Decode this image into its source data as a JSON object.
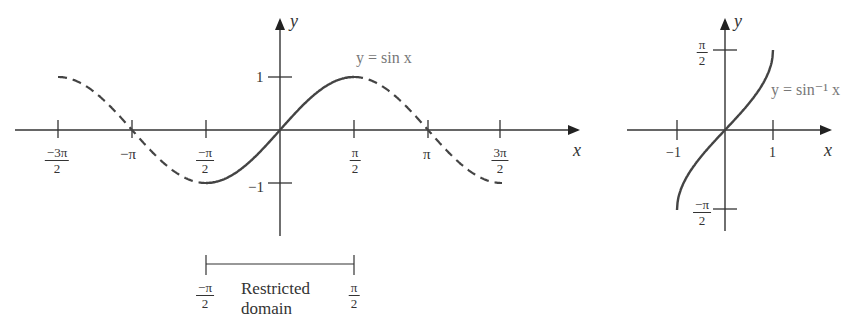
{
  "chart_data": [
    {
      "type": "line",
      "title": "y = sin x",
      "xlabel": "x",
      "ylabel": "y",
      "x_ticks": [
        "-3π/2",
        "-π",
        "-π/2",
        "π/2",
        "π",
        "3π/2"
      ],
      "y_ticks": [
        "1",
        "-1"
      ],
      "xlim": [
        -4.71,
        4.71
      ],
      "ylim": [
        -1,
        1
      ],
      "series": [
        {
          "name": "sin x (full, dashed)",
          "style": "dashed",
          "domain": [
            -4.712,
            4.712
          ]
        },
        {
          "name": "sin x (restricted, solid)",
          "style": "solid",
          "domain": [
            -1.571,
            1.571
          ]
        }
      ],
      "annotation": {
        "label": "Restricted domain",
        "from": "-π/2",
        "to": "π/2"
      }
    },
    {
      "type": "line",
      "title": "y = sin⁻¹ x",
      "xlabel": "x",
      "ylabel": "y",
      "x_ticks": [
        "-1",
        "1"
      ],
      "y_ticks": [
        "π/2",
        "-π/2"
      ],
      "xlim": [
        -1,
        1
      ],
      "ylim": [
        -1.571,
        1.571
      ],
      "series": [
        {
          "name": "arcsin x",
          "style": "solid",
          "domain": [
            -1,
            1
          ]
        }
      ]
    }
  ],
  "left_plot": {
    "axis_x_label": "x",
    "axis_y_label": "y",
    "curve_label": "y = sin x",
    "y_tick_1": "1",
    "y_tick_neg1": "−1",
    "x_ticks": {
      "neg_3pi_2": {
        "num": "−3π",
        "den": "2"
      },
      "neg_pi": "−π",
      "neg_pi_2": {
        "num": "−π",
        "den": "2"
      },
      "pi_2": {
        "num": "π",
        "den": "2"
      },
      "pi": "π",
      "pi3_2": {
        "num": "3π",
        "den": "2"
      }
    },
    "domain_bar": {
      "left": {
        "num": "−π",
        "den": "2"
      },
      "right": {
        "num": "π",
        "den": "2"
      },
      "caption_line1": "Restricted",
      "caption_line2": "domain"
    }
  },
  "right_plot": {
    "axis_x_label": "x",
    "axis_y_label": "y",
    "curve_label": "y = sin⁻¹ x",
    "x_tick_neg1": "−1",
    "x_tick_1": "1",
    "y_tick_top": {
      "num": "π",
      "den": "2"
    },
    "y_tick_bottom": {
      "num": "−π",
      "den": "2"
    }
  },
  "colors": {
    "ink": "#333333",
    "label_gray": "#777777",
    "background": "#ffffff"
  }
}
